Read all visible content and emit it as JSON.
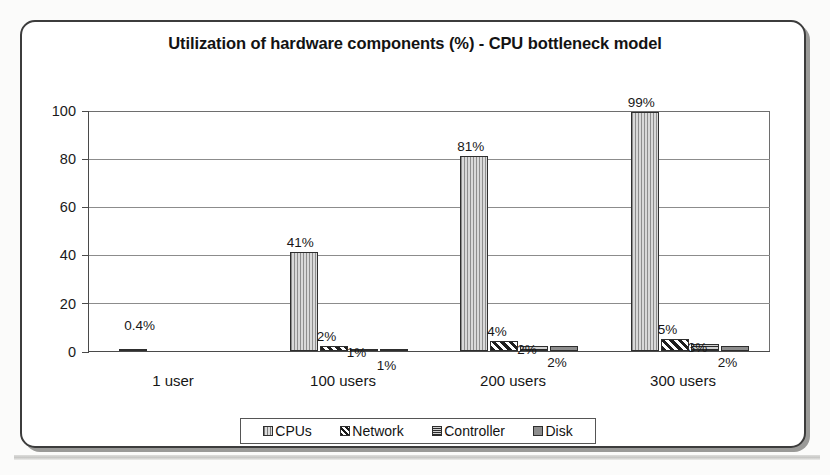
{
  "chart_data": {
    "type": "bar",
    "title": "Utilization of hardware components (%) - CPU bottleneck model",
    "xlabel": "",
    "ylabel": "",
    "ylim": [
      0,
      100
    ],
    "yticks": [
      0,
      20,
      40,
      60,
      80,
      100
    ],
    "grid": true,
    "legend_position": "bottom",
    "categories": [
      "1 user",
      "100 users",
      "200 users",
      "300 users"
    ],
    "series": [
      {
        "name": "CPUs",
        "values": [
          0.4,
          41,
          81,
          99
        ],
        "labels": [
          "0.4%",
          "41%",
          "81%",
          "99%"
        ]
      },
      {
        "name": "Network",
        "values": [
          0,
          2,
          4,
          5
        ],
        "labels": [
          "",
          "2%",
          "4%",
          "5%"
        ]
      },
      {
        "name": "Controller",
        "values": [
          0,
          1,
          2,
          3
        ],
        "labels": [
          "",
          "1%",
          "2%",
          "3%"
        ]
      },
      {
        "name": "Disk",
        "values": [
          0,
          1,
          2,
          2
        ],
        "labels": [
          "",
          "1%",
          "2%",
          "2%"
        ]
      }
    ]
  },
  "axis": {
    "yticks": [
      {
        "label": "100"
      },
      {
        "label": "80"
      },
      {
        "label": "60"
      },
      {
        "label": "40"
      },
      {
        "label": "20"
      },
      {
        "label": "0"
      }
    ]
  },
  "legend": {
    "items": [
      {
        "label": "CPUs",
        "pattern": "vertical-hatch"
      },
      {
        "label": "Network",
        "pattern": "diagonal-hatch"
      },
      {
        "label": "Controller",
        "pattern": "cross-hatch"
      },
      {
        "label": "Disk",
        "pattern": "solid-gray"
      }
    ]
  },
  "colors": {
    "frame_border": "#3c3c3c",
    "gridline": "#8c8c8c",
    "axis": "#4a4a4a",
    "cpus": "#cfcfcf",
    "network": "#ffffff",
    "controller": "#b9b9b9",
    "disk": "#8d8d8d",
    "text": "#131313"
  }
}
